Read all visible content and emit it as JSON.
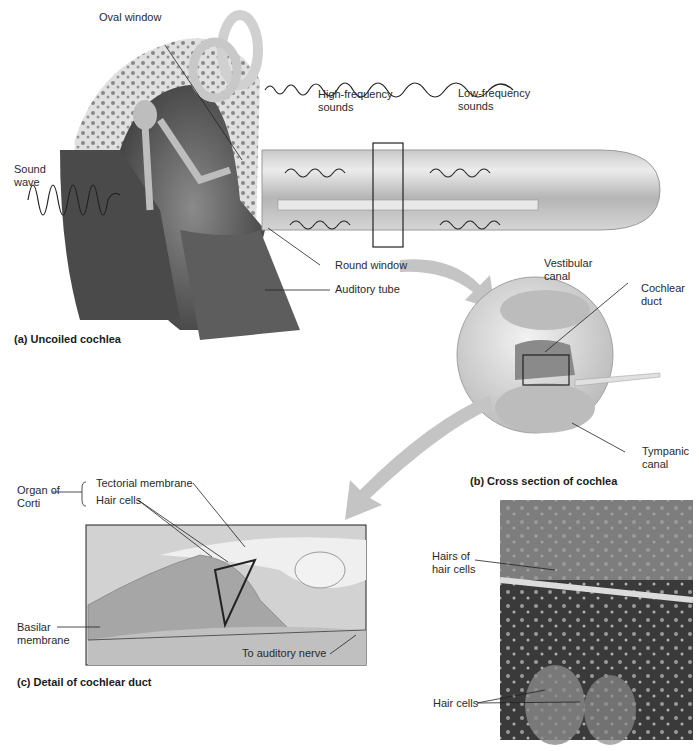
{
  "figure": {
    "panels": [
      {
        "id": "a",
        "caption": "(a) Uncoiled cochlea"
      },
      {
        "id": "b",
        "caption": "(b) Cross section of cochlea"
      },
      {
        "id": "c",
        "caption": "(c) Detail of cochlear duct"
      }
    ],
    "labels": {
      "oval_window": "Oval window",
      "sound_wave_1": "Sound",
      "sound_wave_2": "wave",
      "high_freq_1": "High-frequency",
      "high_freq_2": "sounds",
      "low_freq_1": "Low-frequency",
      "low_freq_2": "sounds",
      "round_window": "Round window",
      "auditory_tube": "Auditory tube",
      "vestibular_1": "Vestibular",
      "vestibular_2": "canal",
      "cochlear_duct_1": "Cochlear",
      "cochlear_duct_2": "duct",
      "tympanic_1": "Tympanic",
      "tympanic_2": "canal",
      "organ_corti_1": "Organ of",
      "organ_corti_2": "Corti",
      "tectorial": "Tectorial membrane",
      "hair_cells_c": "Hair cells",
      "basilar_1": "Basilar",
      "basilar_2": "membrane",
      "auditory_nerve": "To auditory nerve",
      "hairs_of_1": "Hairs of",
      "hairs_of_2": "hair cells",
      "hair_cells_micro": "Hair cells"
    },
    "colors": {
      "tissue_light": "#d9d9d9",
      "tissue_mid": "#a8a8a8",
      "tissue_dark": "#5a5a5a",
      "arrow_gray": "#c4c4c4",
      "line": "#222222"
    }
  }
}
